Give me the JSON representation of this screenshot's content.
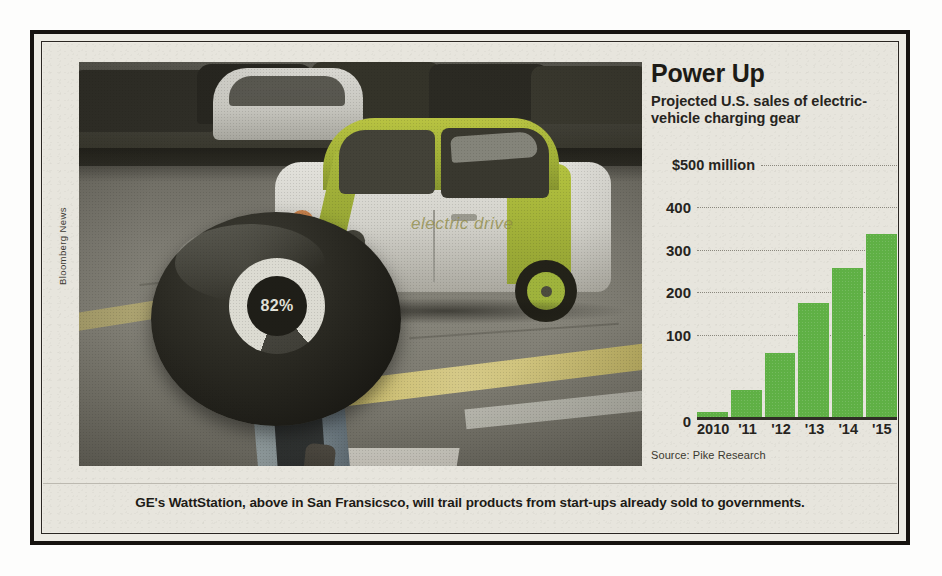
{
  "clipping": {
    "photo_credit": "Bloomberg News",
    "caption": "GE's WattStation, above in San Fransicsco, will trail products from start-ups already sold to governments."
  },
  "photo": {
    "charge_percent": "82%",
    "car_decal": "electric drive"
  },
  "chart": {
    "title": "Power Up",
    "subtitle": "Projected U.S. sales of electric-vehicle charging gear",
    "source": "Source: Pike Research",
    "bar_color": "#5fb045",
    "top_axis_label": "$500 million",
    "zero_label": "0"
  },
  "chart_data": {
    "type": "bar",
    "title": "Power Up",
    "subtitle": "Projected U.S. sales of electric-vehicle charging gear",
    "categories": [
      "2010",
      "'11",
      "'12",
      "'13",
      "'14",
      "'15"
    ],
    "values": [
      13,
      63,
      152,
      270,
      352,
      432
    ],
    "xlabel": "",
    "ylabel": "$ millions",
    "ylim": [
      0,
      500
    ],
    "ytick_labels": [
      "$500 million",
      "400",
      "300",
      "200",
      "100",
      "0"
    ],
    "ytick_values": [
      500,
      400,
      300,
      200,
      100,
      0
    ],
    "grid": "horizontal-dotted",
    "legend": "none",
    "source": "Source: Pike Research",
    "series": [
      {
        "name": "Projected U.S. sales of EV charging gear ($M)",
        "values": [
          13,
          63,
          152,
          270,
          352,
          432
        ]
      }
    ]
  }
}
